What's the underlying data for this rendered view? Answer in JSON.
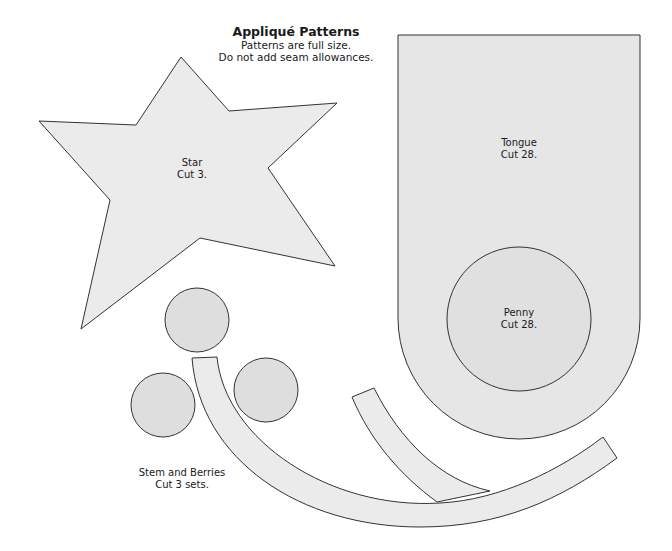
{
  "header": {
    "title": "Appliqué Patterns",
    "line1": "Patterns are full size.",
    "line2": "Do not add seam allowances."
  },
  "patterns": {
    "star": {
      "name": "Star",
      "cut": "Cut 3."
    },
    "tongue": {
      "name": "Tongue",
      "cut": "Cut 28."
    },
    "penny": {
      "name": "Penny",
      "cut": "Cut 28."
    },
    "stem_berries": {
      "name": "Stem and Berries",
      "cut": "Cut 3 sets."
    }
  },
  "colors": {
    "fill_light": "#ebebeb",
    "fill_circle": "#dedede",
    "outline": "#333333"
  }
}
